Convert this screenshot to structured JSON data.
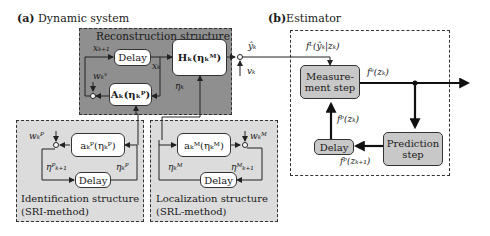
{
  "panel_a": {
    "title_prefix": "(a)",
    "title": "Dynamic system",
    "reconstruction": {
      "title": "Reconstruction structure",
      "delay_label": "Delay",
      "H_block": "Hₖ(ηₖᴹ)",
      "A_block": "Aₖ(ηₖᴾ)",
      "signals": {
        "x_next": "xₖ₊₁",
        "x": "xₖ",
        "w_x": "wₖˣ",
        "eta": "ηₖ"
      },
      "fill_color": "#8f8f8f"
    },
    "identification": {
      "block": "aₖᴾ(ηₖᴾ)",
      "delay_label": "Delay",
      "w": "wₖᴾ",
      "eta_next": "ηᴾₖ₊₁",
      "eta": "ηₖᴾ",
      "caption_line1": "Identification structure",
      "caption_line2": "(SRI-method)",
      "fill_color": "#dcdcdc"
    },
    "localization": {
      "block": "aₖᴹ(ηₖᴹ)",
      "delay_label": "Delay",
      "w": "wₖᴹ",
      "eta": "ηₖᴹ",
      "eta_next": "ηᴹₖ₊₁",
      "caption_line1": "Localization structure",
      "caption_line2": "(SRL-method)",
      "fill_color": "#dcdcdc"
    },
    "output_signals": {
      "y_hat": "ŷₖ",
      "v": "vₖ"
    }
  },
  "panel_b": {
    "title_prefix": "(b)",
    "title": "Estimator",
    "measurement_step": "Measure-\nment step",
    "measurement_line1": "Measure-",
    "measurement_line2": "ment step",
    "prediction_line1": "Prediction",
    "prediction_line2": "step",
    "delay_label": "Delay",
    "signals": {
      "likelihood": "fᴸ(ŷₖ|zₖ)",
      "posterior": "fᵉ(zₖ)",
      "prior": "fᵖ(zₖ)",
      "prior_next": "fᵖ(zₖ₊₁)"
    },
    "block_color": "#c8c8c8"
  }
}
